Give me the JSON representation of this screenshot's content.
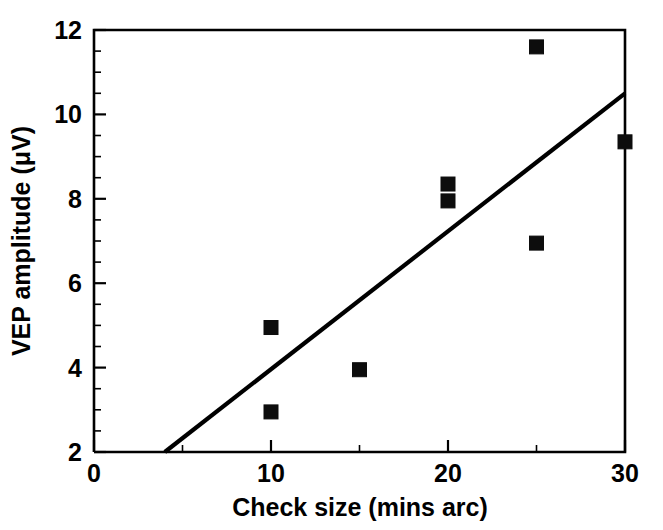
{
  "figure": {
    "background_color": "#ffffff",
    "ink_color": "#000000",
    "cropped_header_text": "",
    "width": 663,
    "height": 530
  },
  "chart_data": {
    "type": "scatter",
    "title": "",
    "subtitle": "",
    "xlabel": "Check size (mins arc)",
    "ylabel": "VEP amplitude (μV)",
    "xlim": [
      0,
      30
    ],
    "ylim": [
      2,
      12
    ],
    "grid": false,
    "legend": null,
    "legend_position": "none",
    "x_ticks_major": [
      0,
      10,
      20,
      30
    ],
    "x_ticklabels": [
      "0",
      "10",
      "20",
      "30"
    ],
    "x_ticks_minor": [
      5,
      15,
      25
    ],
    "y_ticks_major": [
      2,
      4,
      6,
      8,
      10,
      12
    ],
    "y_ticklabels": [
      "2",
      "4",
      "6",
      "8",
      "10",
      "12"
    ],
    "y_ticks_minor": [
      2.5,
      3,
      3.5,
      4.5,
      5,
      5.5,
      6.5,
      7,
      7.5,
      8.5,
      9,
      9.5,
      10.5,
      11,
      11.5
    ],
    "marker_style": "filled-square",
    "marker_color": "#0d0d0d",
    "marker_size_px": 14,
    "x": [
      10,
      10,
      15,
      20,
      20,
      25,
      25,
      30
    ],
    "y": [
      2.95,
      4.95,
      3.95,
      7.95,
      8.35,
      6.95,
      11.6,
      9.35
    ],
    "points": [
      {
        "x": 10,
        "y": 2.95
      },
      {
        "x": 10,
        "y": 4.95
      },
      {
        "x": 15,
        "y": 3.95
      },
      {
        "x": 20,
        "y": 7.95
      },
      {
        "x": 20,
        "y": 8.35
      },
      {
        "x": 25,
        "y": 6.95
      },
      {
        "x": 25,
        "y": 11.6
      },
      {
        "x": 30,
        "y": 9.35
      }
    ],
    "series": [
      {
        "name": "VEP amplitude measurements",
        "type": "scatter",
        "values": [
          2.95,
          4.95,
          3.95,
          7.95,
          8.35,
          6.95,
          11.6,
          9.35
        ]
      },
      {
        "name": "Regression line",
        "type": "line",
        "x": [
          4.0,
          30.0
        ],
        "values": [
          2.0,
          10.5
        ],
        "color": "#000000",
        "line_width_px": 4
      }
    ],
    "annotations": []
  },
  "axes": {
    "x_axis_name": "Check size (mins arc)",
    "y_axis_name": "VEP amplitude (μV)",
    "x_unit": "mins arc",
    "y_unit": "μV"
  }
}
